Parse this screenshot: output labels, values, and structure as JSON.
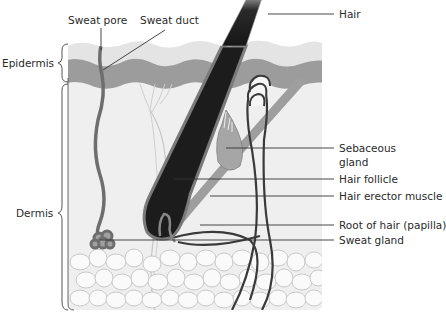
{
  "figure": {
    "layers": [
      {
        "name": "Epidermis",
        "label": "Epidermis"
      },
      {
        "name": "Dermis",
        "label": "Dermis"
      }
    ],
    "labels_top": {
      "sweat_pore": "Sweat pore",
      "sweat_duct": "Sweat duct"
    },
    "labels_right": {
      "hair": "Hair",
      "sebaceous_line1": "Sebaceous",
      "sebaceous_line2": "gland",
      "hair_follicle": "Hair follicle",
      "hair_erector_muscle": "Hair erector muscle",
      "root_of_hair": "Root of hair (papilla)",
      "sweat_gland": "Sweat gland"
    },
    "colors": {
      "epidermis_top": "#e6e6e6",
      "epidermis_band": "#9a9a9a",
      "dermis": "#f0f0f0",
      "hair": "#1e1e1e",
      "muscle": "#9e9e9e",
      "gland": "#a8a8a8",
      "fat_cell_stroke": "#c8c8c8",
      "leader_line": "#333333"
    }
  }
}
